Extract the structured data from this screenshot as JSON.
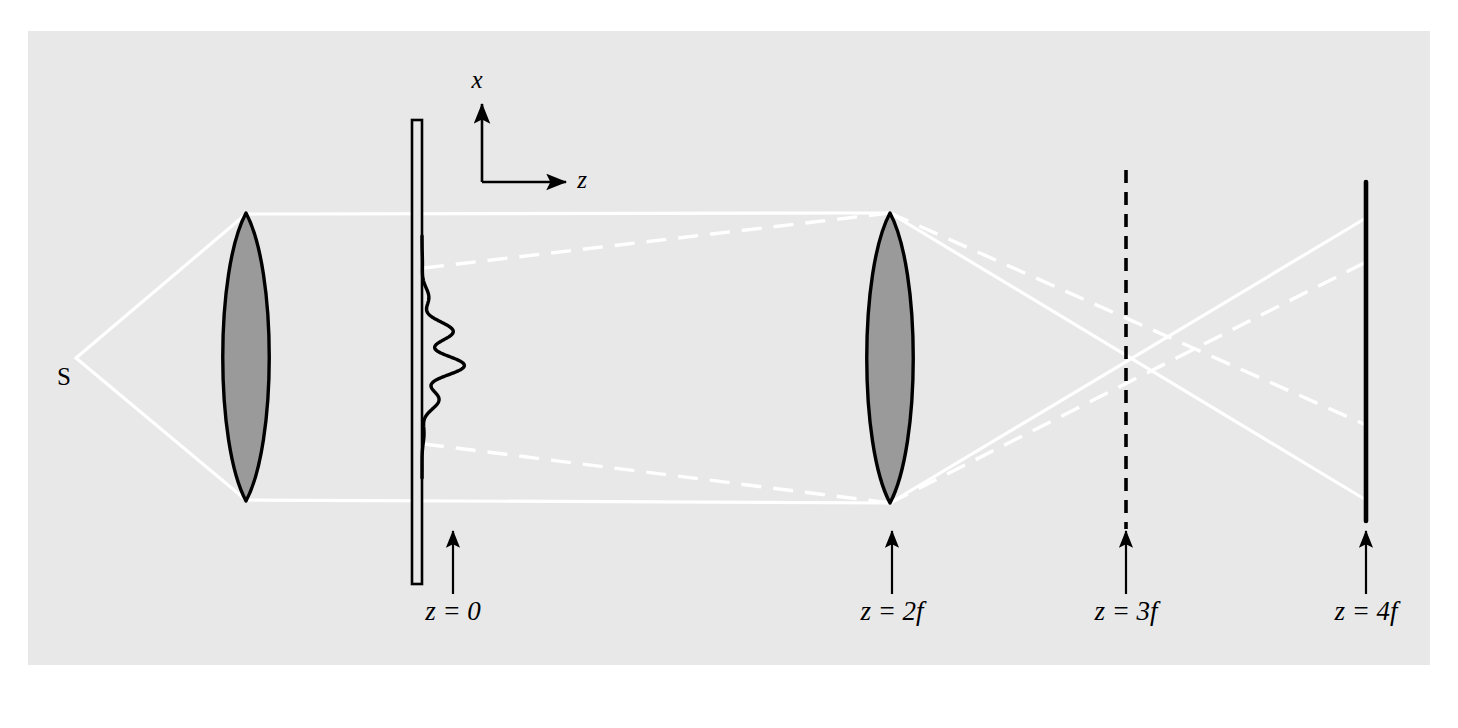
{
  "figure": {
    "domain": "diagram",
    "canvas": {
      "width": 1458,
      "height": 728
    },
    "panel": {
      "x": 28,
      "y": 31,
      "width": 1402,
      "height": 634,
      "fill": "#e8e8e8"
    },
    "page_background": "#ffffff"
  },
  "colors": {
    "panel_background": "#e8e8e8",
    "ray": "#ffffff",
    "ink": "#000000",
    "lens_fill": "#9a9a9a",
    "lens_stroke": "#000000",
    "screen": "#000000"
  },
  "axes": {
    "origin": {
      "x": 482,
      "y": 182
    },
    "x_axis": {
      "label": "x",
      "label_x": 477,
      "label_y": 88,
      "from": {
        "x": 482,
        "y": 182
      },
      "to": {
        "x": 482,
        "y": 104
      }
    },
    "z_axis": {
      "label": "z",
      "label_x": 582,
      "label_y": 188,
      "from": {
        "x": 482,
        "y": 182
      },
      "to": {
        "x": 566,
        "y": 182
      }
    }
  },
  "source": {
    "label": "S",
    "point": {
      "x": 76,
      "y": 358
    },
    "label_x": 64,
    "label_y": 385
  },
  "elements": [
    {
      "name": "lens-1",
      "kind": "lens",
      "center_x": 246,
      "top_y": 213,
      "bottom_y": 501,
      "half_width": 31,
      "fill": "#9a9a9a"
    },
    {
      "name": "grating-plane",
      "kind": "aperture-bar",
      "x": 412,
      "width": 10,
      "top_y": 120,
      "bottom_y": 584,
      "fill": "none",
      "z_label": "z = 0"
    },
    {
      "name": "lens-2",
      "kind": "lens",
      "center_x": 890,
      "top_y": 213,
      "bottom_y": 503,
      "half_width": 31,
      "fill": "#9a9a9a",
      "z_label": "z = 2f"
    },
    {
      "name": "fourier-plane",
      "kind": "dashed-plane",
      "x": 1126,
      "top_y": 170,
      "bottom_y": 529,
      "z_label": "z = 3f"
    },
    {
      "name": "image-screen",
      "kind": "solid-screen",
      "x": 1366,
      "top_y": 182,
      "bottom_y": 521,
      "z_label": "z = 4f"
    }
  ],
  "z_labels": [
    {
      "text": "z = 0",
      "text_x": 453,
      "text_y": 620,
      "arrow_x": 453,
      "arrow_top_y": 531,
      "arrow_bottom_y": 594
    },
    {
      "text": "z = 2f",
      "text_x": 892,
      "text_y": 620,
      "arrow_x": 892,
      "arrow_top_y": 531,
      "arrow_bottom_y": 594
    },
    {
      "text": "z = 3f",
      "text_x": 1126,
      "text_y": 620,
      "arrow_x": 1126,
      "arrow_top_y": 531,
      "arrow_bottom_y": 594
    },
    {
      "text": "z = 4f",
      "text_x": 1366,
      "text_y": 620,
      "arrow_x": 1366,
      "arrow_top_y": 531,
      "arrow_bottom_y": 594
    }
  ],
  "rays": {
    "description": "White rays: solid = marginal/edge rays, dashed = rays through the grating diffraction orders",
    "solid": [
      {
        "name": "ray-source-to-lens1-top",
        "points": "76,358 246,214"
      },
      {
        "name": "ray-source-to-lens1-bottom",
        "points": "76,358 246,500"
      },
      {
        "name": "ray-collimated-top",
        "points": "246,214 890,213"
      },
      {
        "name": "ray-collimated-bottom",
        "points": "246,500 890,503"
      },
      {
        "name": "ray-lens2-top-to-screen",
        "points": "890,213 1366,500"
      },
      {
        "name": "ray-lens2-bottom-to-screen",
        "points": "890,503 1366,218"
      }
    ],
    "dashed": [
      {
        "name": "diffracted-order-up",
        "points": "424,268 890,213"
      },
      {
        "name": "diffracted-order-down",
        "points": "424,444 890,503"
      },
      {
        "name": "image-ray-upper",
        "points": "890,213 1366,425"
      },
      {
        "name": "image-ray-lower",
        "points": "890,503 1366,262"
      }
    ],
    "crossings": [
      {
        "name": "solid-ray-crossing",
        "x": 1126,
        "y": 360
      },
      {
        "name": "dashed-ray-crossing",
        "x": 1126,
        "y": 325
      }
    ]
  },
  "transmission_curve": {
    "name": "grating-transmission-profile",
    "axis_x": 422,
    "top_y": 236,
    "bottom_y": 478,
    "max_amplitude": 44,
    "cycles": 6.5,
    "description": "Gaussian-enveloped sinusoidal transmittance function plotted along x at the z = 0 plane"
  }
}
